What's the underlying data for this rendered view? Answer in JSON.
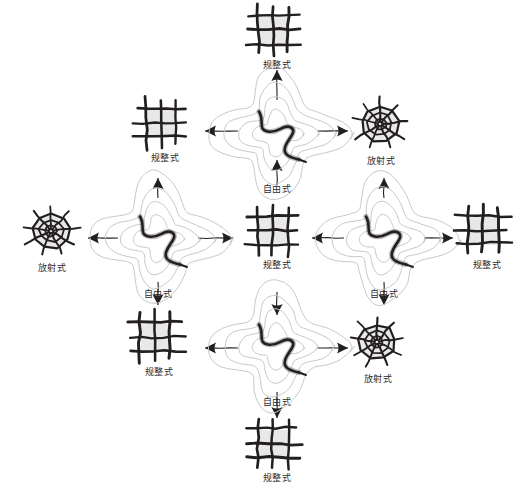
{
  "diagram": {
    "background_color": "#ffffff",
    "ink_color": "#231f20",
    "fill_color": "#e8e8e8",
    "contour_color": "#c9c9c9",
    "labels": {
      "regular": "规整式",
      "free": "自由式",
      "radial": "放射式"
    },
    "icon_names": {
      "regular": "grid-pattern-icon",
      "free": "river-contour-pattern-icon",
      "radial": "radial-web-pattern-icon"
    },
    "nodes": [
      {
        "id": "n-top",
        "type": "regular",
        "label": "规整式",
        "x": 277,
        "y": 38
      },
      {
        "id": "n-tl",
        "type": "regular",
        "label": "规整式",
        "x": 165,
        "y": 131
      },
      {
        "id": "n-t-free",
        "type": "free",
        "label": "自由式",
        "x": 277,
        "y": 135
      },
      {
        "id": "n-tr",
        "type": "radial",
        "label": "放射式",
        "x": 381,
        "y": 131
      },
      {
        "id": "n-left",
        "type": "radial",
        "label": "放射式",
        "x": 52,
        "y": 238
      },
      {
        "id": "n-l-free",
        "type": "free",
        "label": "自由式",
        "x": 158,
        "y": 240
      },
      {
        "id": "n-center",
        "type": "regular",
        "label": "规整式",
        "x": 277,
        "y": 238
      },
      {
        "id": "n-r-free",
        "type": "free",
        "label": "自由式",
        "x": 384,
        "y": 240
      },
      {
        "id": "n-right",
        "type": "regular",
        "label": "规整式",
        "x": 487,
        "y": 238
      },
      {
        "id": "n-bl",
        "type": "regular",
        "label": "规整式",
        "x": 159,
        "y": 345
      },
      {
        "id": "n-b-free",
        "type": "free",
        "label": "自由式",
        "x": 277,
        "y": 348
      },
      {
        "id": "n-br",
        "type": "radial",
        "label": "放射式",
        "x": 378,
        "y": 349
      },
      {
        "id": "n-bottom",
        "type": "regular",
        "label": "规整式",
        "x": 277,
        "y": 451
      }
    ],
    "arrows": [
      {
        "name": "arrow-top-free-to-top",
        "x1": 277,
        "y1": 100,
        "x2": 277,
        "y2": 70,
        "dir": "up"
      },
      {
        "name": "arrow-top-free-to-tl",
        "x1": 238,
        "y1": 131,
        "x2": 205,
        "y2": 131,
        "dir": "left"
      },
      {
        "name": "arrow-top-free-to-tr",
        "x1": 318,
        "y1": 131,
        "x2": 348,
        "y2": 131,
        "dir": "right"
      },
      {
        "name": "arrow-center-to-top-free",
        "x1": 277,
        "y1": 185,
        "x2": 277,
        "y2": 160,
        "dir": "up"
      },
      {
        "name": "arrow-left-free-to-left",
        "x1": 118,
        "y1": 238,
        "x2": 88,
        "y2": 238,
        "dir": "left"
      },
      {
        "name": "arrow-left-free-to-center",
        "x1": 198,
        "y1": 238,
        "x2": 233,
        "y2": 238,
        "dir": "right"
      },
      {
        "name": "arrow-left-free-up",
        "x1": 158,
        "y1": 198,
        "x2": 158,
        "y2": 178,
        "dir": "up"
      },
      {
        "name": "arrow-left-free-down",
        "x1": 158,
        "y1": 282,
        "x2": 158,
        "y2": 305,
        "dir": "down"
      },
      {
        "name": "arrow-right-free-to-center",
        "x1": 344,
        "y1": 238,
        "x2": 312,
        "y2": 238,
        "dir": "left"
      },
      {
        "name": "arrow-right-free-to-right",
        "x1": 424,
        "y1": 238,
        "x2": 453,
        "y2": 238,
        "dir": "right"
      },
      {
        "name": "arrow-right-free-up",
        "x1": 384,
        "y1": 198,
        "x2": 384,
        "y2": 178,
        "dir": "up"
      },
      {
        "name": "arrow-right-free-down",
        "x1": 384,
        "y1": 282,
        "x2": 384,
        "y2": 305,
        "dir": "down"
      },
      {
        "name": "arrow-center-to-bottom-free",
        "x1": 277,
        "y1": 292,
        "x2": 277,
        "y2": 315,
        "dir": "down"
      },
      {
        "name": "arrow-bot-free-to-bl",
        "x1": 238,
        "y1": 348,
        "x2": 205,
        "y2": 348,
        "dir": "left"
      },
      {
        "name": "arrow-bot-free-to-br",
        "x1": 318,
        "y1": 348,
        "x2": 348,
        "y2": 348,
        "dir": "right"
      },
      {
        "name": "arrow-bot-free-to-bottom",
        "x1": 277,
        "y1": 392,
        "x2": 277,
        "y2": 418,
        "dir": "down"
      }
    ]
  }
}
